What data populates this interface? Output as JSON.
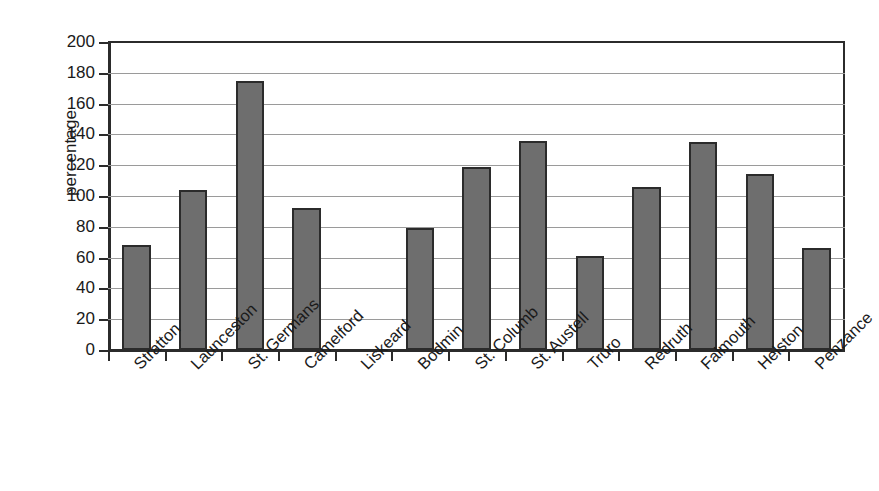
{
  "chart_data": {
    "type": "bar",
    "title": "",
    "xlabel": "",
    "ylabel": "percentage",
    "ylim": [
      0,
      200
    ],
    "ytick_step": 20,
    "grid": true,
    "legend": "none",
    "bar_color": "#6e6e6e",
    "bar_border_color": "#2b2b2b",
    "gridline_color": "#9a9a9a",
    "axis_color": "#2b2b2b",
    "text_color": "#1a1a1a",
    "background": "#ffffff",
    "xlabel_rotation_degrees": -45,
    "categories": [
      "Stratton",
      "Launceston",
      "St. Germans",
      "Camelford",
      "Liskeard",
      "Bodmin",
      "St. Columb",
      "St. Austell",
      "Truro",
      "Redruth",
      "Falmouth",
      "Helston",
      "Penzance"
    ],
    "values": [
      68,
      104,
      175,
      92,
      0,
      79,
      119,
      136,
      61,
      106,
      135,
      114,
      66
    ],
    "yticks": [
      0,
      20,
      40,
      60,
      80,
      100,
      120,
      140,
      160,
      180,
      200
    ],
    "ytick_labels": [
      "0",
      "20",
      "40",
      "60",
      "80",
      "100",
      "120",
      "140",
      "160",
      "180",
      "200"
    ]
  }
}
